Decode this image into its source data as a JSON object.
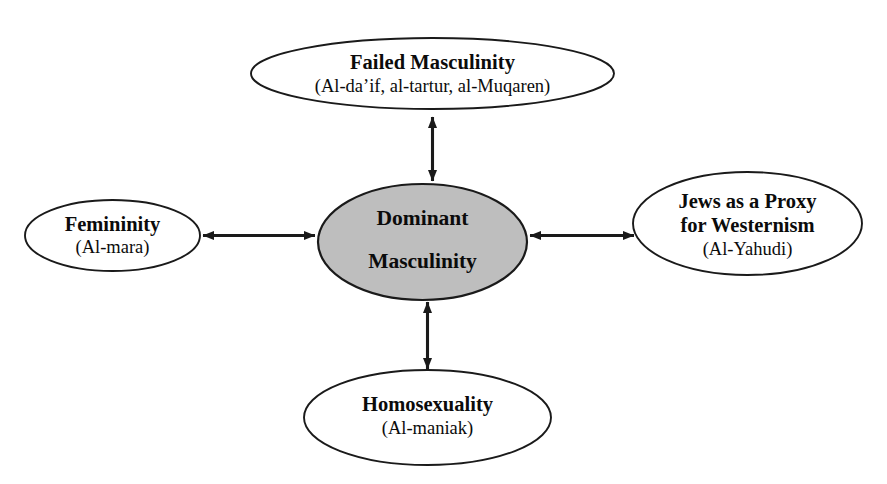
{
  "diagram": {
    "type": "radial-relationship-diagram",
    "canvas": {
      "width": 887,
      "height": 484
    },
    "background_color": "#ffffff",
    "stroke_color": "#1a1a1a",
    "center_fill_color": "#bebebe",
    "node_fill_color": "#ffffff",
    "center": {
      "id": "dominant-masculinity",
      "title_line_1": "Dominant",
      "title_line_2": "Masculinity",
      "shape": "ellipse",
      "filled": true
    },
    "nodes": [
      {
        "id": "failed-masculinity",
        "position": "top",
        "title": "Failed Masculinity",
        "subtitle": "(Al-da’if, al-tartur, al-Muqaren)",
        "shape": "ellipse"
      },
      {
        "id": "femininity",
        "position": "left",
        "title": "Femininity",
        "subtitle": "(Al-mara)",
        "shape": "ellipse"
      },
      {
        "id": "jews-as-a-proxy-for-westernism",
        "position": "right",
        "title_line_1": "Jews as a Proxy",
        "title_line_2": "for Westernism",
        "subtitle": "(Al-Yahudi)",
        "shape": "ellipse"
      },
      {
        "id": "homosexuality",
        "position": "bottom",
        "title": "Homosexuality",
        "subtitle": "(Al-maniak)",
        "shape": "ellipse"
      }
    ],
    "connectors": [
      {
        "id": "connector-top",
        "from": "dominant-masculinity",
        "to": "failed-masculinity",
        "style": "double-headed-arrow",
        "orientation": "vertical"
      },
      {
        "id": "connector-left",
        "from": "dominant-masculinity",
        "to": "femininity",
        "style": "double-headed-arrow",
        "orientation": "horizontal"
      },
      {
        "id": "connector-right",
        "from": "dominant-masculinity",
        "to": "jews-as-a-proxy-for-westernism",
        "style": "double-headed-arrow",
        "orientation": "horizontal"
      },
      {
        "id": "connector-bottom",
        "from": "dominant-masculinity",
        "to": "homosexuality",
        "style": "double-headed-arrow",
        "orientation": "vertical"
      }
    ]
  }
}
